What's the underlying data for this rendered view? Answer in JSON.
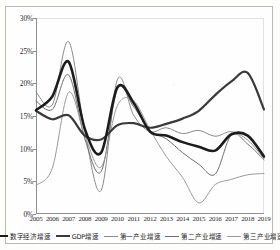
{
  "chart_data": {
    "type": "line",
    "title": "",
    "xlabel": "",
    "ylabel": "",
    "grid": false,
    "legend_position": "bottom",
    "x": [
      2005,
      2006,
      2007,
      2008,
      2009,
      2010,
      2011,
      2012,
      2013,
      2014,
      2015,
      2016,
      2017,
      2018,
      2019
    ],
    "categories": [
      "2005",
      "2006",
      "2007",
      "2008",
      "2009",
      "2010",
      "2011",
      "2012",
      "2013",
      "2014",
      "2015",
      "2016",
      "2017",
      "2018",
      "2019"
    ],
    "ylim": [
      0,
      30
    ],
    "ytick_labels": [
      "0%",
      "5%",
      "10%",
      "15%",
      "20%",
      "25%",
      "30%"
    ],
    "ytick_values": [
      0,
      5,
      10,
      15,
      20,
      25,
      30
    ],
    "series": [
      {
        "name": "数字经济增速",
        "color": "#1c1c1c",
        "width": 2.6,
        "values": [
          15.9,
          18.0,
          23.3,
          13.0,
          9.4,
          19.4,
          17.0,
          12.6,
          12.0,
          11.0,
          10.3,
          9.7,
          12.2,
          12.0,
          8.8
        ]
      },
      {
        "name": "GDP增速",
        "color": "#3a3a3a",
        "width": 2.2,
        "values": [
          15.8,
          14.5,
          15.1,
          12.0,
          11.4,
          13.6,
          13.9,
          13.2,
          13.8,
          14.6,
          15.8,
          18.2,
          20.3,
          21.6,
          16.0
        ]
      },
      {
        "name": "第一产业增速",
        "color": "#8a8a8a",
        "width": 1.0,
        "values": [
          18.7,
          16.7,
          26.4,
          12.6,
          3.6,
          20.6,
          15.1,
          12.6,
          13.2,
          12.3,
          12.8,
          11.9,
          12.6,
          11.3,
          8.5
        ]
      },
      {
        "name": "第二产业增速",
        "color": "#6e6e6e",
        "width": 1.0,
        "values": [
          17.3,
          16.0,
          21.3,
          11.5,
          6.5,
          19.1,
          16.4,
          12.8,
          11.5,
          9.4,
          7.6,
          6.1,
          12.1,
          10.7,
          8.3
        ]
      },
      {
        "name": "第三产业增速",
        "color": "#9a9a9a",
        "width": 1.0,
        "values": [
          4.4,
          7.0,
          18.6,
          12.0,
          7.2,
          16.6,
          17.3,
          12.9,
          8.8,
          5.6,
          1.7,
          4.5,
          5.3,
          6.0,
          6.2
        ]
      }
    ]
  },
  "legend": {
    "items": [
      {
        "label": "数字经济增速"
      },
      {
        "label": "GDP增速"
      },
      {
        "label": "第一产业增速"
      },
      {
        "label": "第二产业增速"
      },
      {
        "label": "第三产业增速"
      }
    ]
  }
}
